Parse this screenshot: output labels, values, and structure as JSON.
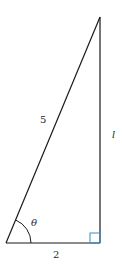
{
  "diagram": {
    "type": "right-triangle",
    "colors": {
      "stroke": "#1a1a1a",
      "right_angle_marker": "#3a8fc8",
      "background": "#ffffff"
    },
    "vertices": {
      "top": [
        100,
        17
      ],
      "bottom_left": [
        6,
        243
      ],
      "bottom_right": [
        100,
        243
      ]
    },
    "labels": {
      "hypotenuse": "5",
      "opposite": "l",
      "adjacent": "2",
      "angle": "θ"
    }
  }
}
